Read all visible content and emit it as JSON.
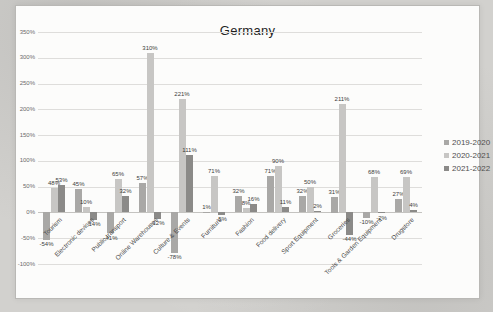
{
  "title": "Germany",
  "colors": {
    "s1": "#a9a8a6",
    "s2": "#c7c6c4",
    "s3": "#8b8a88",
    "panel": "#fcfcfb",
    "grid": "#dedddb",
    "axis_text": "#6b6b6b",
    "label_text": "#3c3c3c"
  },
  "chart_data": {
    "type": "bar",
    "title": "Germany",
    "categories": [
      "Tourism",
      "Electronic devices",
      "Public transport",
      "Online Warehouses",
      "Culture & Events",
      "Furniture",
      "Fashion",
      "Food delivery",
      "Sport Equipment",
      "Groceries",
      "Tools & Garden Equipment",
      "Drugstore"
    ],
    "series": [
      {
        "name": "2019-2020",
        "color_key": "s1",
        "values": [
          -54,
          45,
          -41,
          57,
          -78,
          1,
          32,
          71,
          32,
          31,
          -10,
          27
        ]
      },
      {
        "name": "2020-2021",
        "color_key": "s2",
        "values": [
          48,
          10,
          65,
          310,
          221,
          71,
          8,
          90,
          50,
          211,
          68,
          69
        ]
      },
      {
        "name": "2021-2022",
        "color_key": "s3",
        "values": [
          53,
          -14,
          32,
          -12,
          111,
          -5,
          16,
          11,
          2,
          -44,
          -2,
          4
        ]
      }
    ],
    "ylim": [
      -100,
      350
    ],
    "ytick_step": 50,
    "ytick_labels": [
      "350%",
      "300%",
      "250%",
      "200%",
      "150%",
      "100%",
      "50%",
      "0%",
      "-50%",
      "-100%"
    ],
    "data_label_suffix": "%",
    "grid": true,
    "legend_position": "right"
  }
}
